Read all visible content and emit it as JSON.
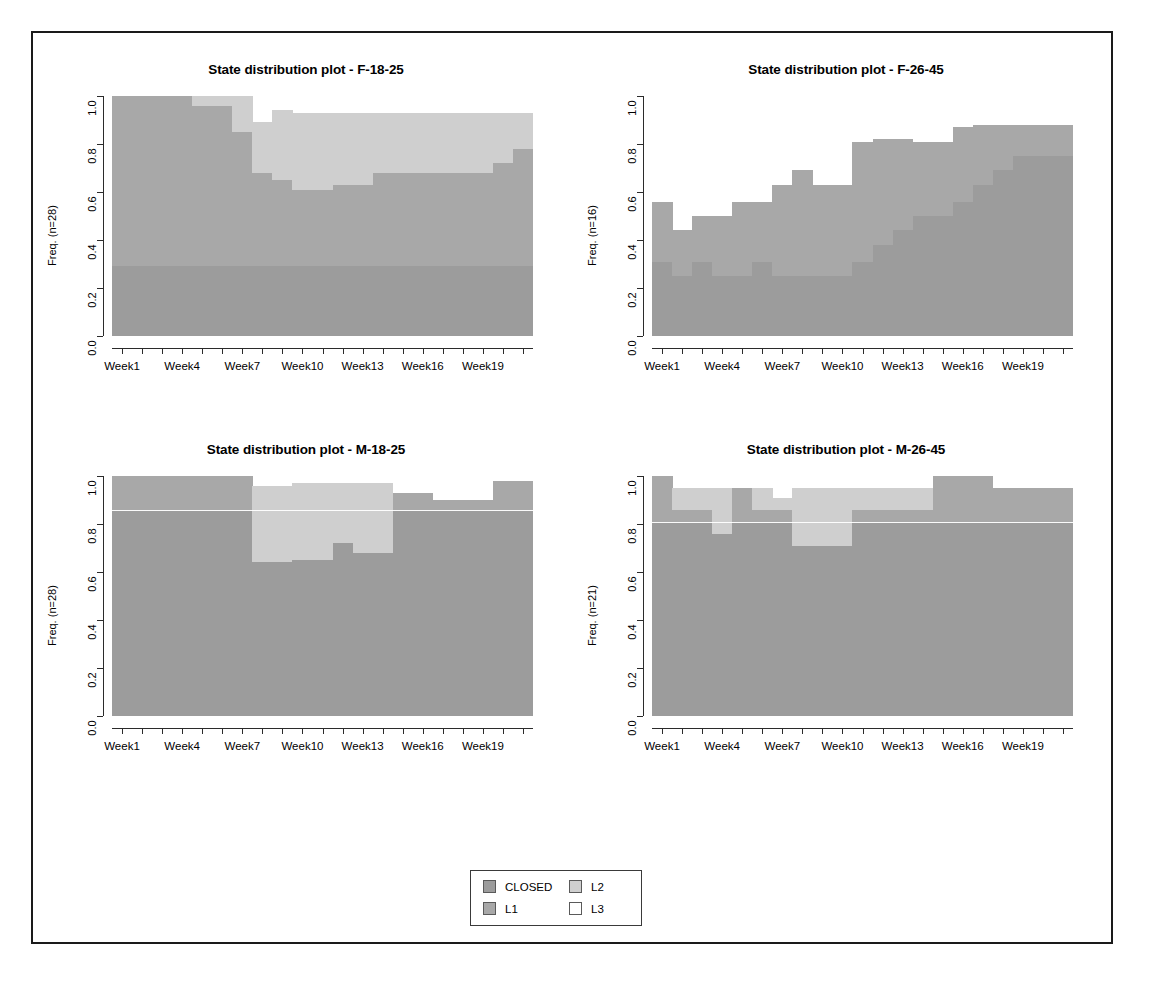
{
  "figure": {
    "panel_title_prefix": "State distribution plot - ",
    "legend": {
      "items": [
        {
          "label": "CLOSED",
          "color": "#9c9c9c"
        },
        {
          "label": "L1",
          "color": "#a8a8a8"
        },
        {
          "label": "L2",
          "color": "#cfcfcf"
        },
        {
          "label": "L3",
          "color": "#ffffff"
        }
      ]
    }
  },
  "chart_data": [
    {
      "type": "area",
      "title": "State distribution plot -  F-18-25",
      "xlabel": "",
      "ylabel": "Freq. (n=28)",
      "ylim": [
        0,
        1
      ],
      "yticks": [
        "0.0",
        "0.2",
        "0.4",
        "0.6",
        "0.8",
        "1.0"
      ],
      "categories": [
        "Week1",
        "Week2",
        "Week3",
        "Week4",
        "Week5",
        "Week6",
        "Week7",
        "Week8",
        "Week9",
        "Week10",
        "Week11",
        "Week12",
        "Week13",
        "Week14",
        "Week15",
        "Week16",
        "Week17",
        "Week18",
        "Week19",
        "Week20",
        "Week21"
      ],
      "xtick_labels": [
        "Week1",
        "Week4",
        "Week7",
        "Week10",
        "Week13",
        "Week16",
        "Week19"
      ],
      "xtick_indices": [
        0,
        3,
        6,
        9,
        12,
        15,
        18
      ],
      "legend_position": "bottom",
      "grid": false,
      "series": [
        {
          "name": "CLOSED",
          "values": [
            0.29,
            0.29,
            0.29,
            0.29,
            0.29,
            0.29,
            0.29,
            0.29,
            0.29,
            0.29,
            0.29,
            0.29,
            0.29,
            0.29,
            0.29,
            0.29,
            0.29,
            0.29,
            0.29,
            0.29,
            0.29
          ]
        },
        {
          "name": "L1",
          "values": [
            0.71,
            0.71,
            0.71,
            0.71,
            0.67,
            0.67,
            0.56,
            0.39,
            0.36,
            0.32,
            0.32,
            0.34,
            0.34,
            0.39,
            0.39,
            0.39,
            0.39,
            0.39,
            0.39,
            0.43,
            0.49
          ]
        },
        {
          "name": "L2",
          "values": [
            0.0,
            0.0,
            0.0,
            0.0,
            0.29,
            0.29,
            0.39,
            0.21,
            0.29,
            0.32,
            0.32,
            0.3,
            0.3,
            0.25,
            0.25,
            0.25,
            0.25,
            0.25,
            0.25,
            0.21,
            0.15
          ]
        },
        {
          "name": "L3",
          "values": [
            0.0,
            0.0,
            0.0,
            0.0,
            0.04,
            0.04,
            0.07,
            0.11,
            0.07,
            0.07,
            0.07,
            0.07,
            0.07,
            0.07,
            0.07,
            0.07,
            0.07,
            0.07,
            0.07,
            0.07,
            0.07
          ]
        }
      ]
    },
    {
      "type": "area",
      "title": "State distribution plot -  F-26-45",
      "xlabel": "",
      "ylabel": "Freq. (n=16)",
      "ylim": [
        0,
        1
      ],
      "yticks": [
        "0.0",
        "0.2",
        "0.4",
        "0.6",
        "0.8",
        "1.0"
      ],
      "categories": [
        "Week1",
        "Week2",
        "Week3",
        "Week4",
        "Week5",
        "Week6",
        "Week7",
        "Week8",
        "Week9",
        "Week10",
        "Week11",
        "Week12",
        "Week13",
        "Week14",
        "Week15",
        "Week16",
        "Week17",
        "Week18",
        "Week19",
        "Week20",
        "Week21"
      ],
      "xtick_labels": [
        "Week1",
        "Week4",
        "Week7",
        "Week10",
        "Week13",
        "Week16",
        "Week19"
      ],
      "xtick_indices": [
        0,
        3,
        6,
        9,
        12,
        15,
        18
      ],
      "legend_position": "bottom",
      "grid": false,
      "series": [
        {
          "name": "CLOSED",
          "values": [
            0.31,
            0.25,
            0.31,
            0.25,
            0.25,
            0.31,
            0.25,
            0.25,
            0.25,
            0.25,
            0.31,
            0.38,
            0.44,
            0.5,
            0.5,
            0.56,
            0.63,
            0.69,
            0.75,
            0.75,
            0.75
          ]
        },
        {
          "name": "L1",
          "values": [
            0.25,
            0.19,
            0.19,
            0.25,
            0.31,
            0.25,
            0.38,
            0.44,
            0.38,
            0.38,
            0.5,
            0.44,
            0.38,
            0.31,
            0.31,
            0.31,
            0.25,
            0.19,
            0.13,
            0.13,
            0.13
          ]
        },
        {
          "name": "L2",
          "values": [
            0.0,
            0.0,
            0.0,
            0.0,
            0.0,
            0.0,
            0.0,
            0.0,
            0.0,
            0.0,
            0.0,
            0.0,
            0.0,
            0.0,
            0.0,
            0.0,
            0.0,
            0.0,
            0.0,
            0.0,
            0.0
          ]
        },
        {
          "name": "L3",
          "values": [
            0.44,
            0.56,
            0.5,
            0.5,
            0.44,
            0.44,
            0.37,
            0.31,
            0.37,
            0.37,
            0.19,
            0.18,
            0.18,
            0.19,
            0.19,
            0.13,
            0.12,
            0.12,
            0.12,
            0.12,
            0.12
          ]
        }
      ]
    },
    {
      "type": "area",
      "title": "State distribution plot -  M-18-25",
      "xlabel": "",
      "ylabel": "Freq. (n=28)",
      "ylim": [
        0,
        1
      ],
      "yticks": [
        "0.0",
        "0.2",
        "0.4",
        "0.6",
        "0.8",
        "1.0"
      ],
      "categories": [
        "Week1",
        "Week2",
        "Week3",
        "Week4",
        "Week5",
        "Week6",
        "Week7",
        "Week8",
        "Week9",
        "Week10",
        "Week11",
        "Week12",
        "Week13",
        "Week14",
        "Week15",
        "Week16",
        "Week17",
        "Week18",
        "Week19",
        "Week20",
        "Week21"
      ],
      "xtick_labels": [
        "Week1",
        "Week4",
        "Week7",
        "Week10",
        "Week13",
        "Week16",
        "Week19"
      ],
      "xtick_indices": [
        0,
        3,
        6,
        9,
        12,
        15,
        18
      ],
      "legend_position": "bottom",
      "grid": false,
      "series": [
        {
          "name": "CLOSED",
          "values": [
            0.86,
            0.86,
            0.86,
            0.86,
            0.86,
            0.86,
            0.86,
            0.86,
            0.86,
            0.86,
            0.86,
            0.86,
            0.86,
            0.86,
            0.86,
            0.86,
            0.86,
            0.86,
            0.86,
            0.86,
            0.86
          ]
        },
        {
          "name": "L1",
          "values": [
            0.14,
            0.14,
            0.14,
            0.14,
            0.14,
            0.14,
            0.14,
            -0.22,
            -0.22,
            -0.21,
            -0.21,
            -0.14,
            -0.18,
            -0.18,
            0.07,
            0.07,
            0.04,
            0.04,
            0.04,
            0.12,
            0.12
          ]
        },
        {
          "name": "L2",
          "values": [
            0.0,
            0.0,
            0.0,
            0.0,
            0.0,
            0.0,
            0.0,
            0.32,
            0.32,
            0.32,
            0.32,
            0.25,
            0.29,
            0.29,
            0.0,
            0.0,
            0.0,
            0.0,
            0.0,
            0.0,
            0.0
          ]
        },
        {
          "name": "L3",
          "values": [
            0.0,
            0.0,
            0.0,
            0.0,
            0.0,
            0.0,
            0.0,
            0.04,
            0.04,
            0.03,
            0.03,
            0.03,
            0.03,
            0.03,
            0.07,
            0.07,
            0.1,
            0.1,
            0.1,
            0.02,
            0.02
          ]
        }
      ]
    },
    {
      "type": "area",
      "title": "State distribution plot -  M-26-45",
      "xlabel": "",
      "ylabel": "Freq. (n=21)",
      "ylim": [
        0,
        1
      ],
      "yticks": [
        "0.0",
        "0.2",
        "0.4",
        "0.6",
        "0.8",
        "1.0"
      ],
      "categories": [
        "Week1",
        "Week2",
        "Week3",
        "Week4",
        "Week5",
        "Week6",
        "Week7",
        "Week8",
        "Week9",
        "Week10",
        "Week11",
        "Week12",
        "Week13",
        "Week14",
        "Week15",
        "Week16",
        "Week17",
        "Week18",
        "Week19",
        "Week20",
        "Week21"
      ],
      "xtick_labels": [
        "Week1",
        "Week4",
        "Week7",
        "Week10",
        "Week13",
        "Week16",
        "Week19"
      ],
      "xtick_indices": [
        0,
        3,
        6,
        9,
        12,
        15,
        18
      ],
      "legend_position": "bottom",
      "grid": false,
      "series": [
        {
          "name": "CLOSED",
          "values": [
            0.81,
            0.81,
            0.81,
            0.81,
            0.81,
            0.81,
            0.81,
            0.81,
            0.81,
            0.81,
            0.81,
            0.81,
            0.81,
            0.81,
            0.81,
            0.81,
            0.81,
            0.81,
            0.81,
            0.81,
            0.81
          ]
        },
        {
          "name": "L1",
          "values": [
            0.19,
            0.05,
            0.05,
            -0.05,
            0.14,
            0.05,
            0.05,
            -0.1,
            -0.1,
            -0.1,
            0.05,
            0.05,
            0.05,
            0.05,
            0.19,
            0.19,
            0.19,
            0.14,
            0.14,
            0.14,
            0.14
          ]
        },
        {
          "name": "L2",
          "values": [
            0.0,
            0.09,
            0.09,
            0.19,
            0.0,
            0.09,
            0.05,
            0.24,
            0.24,
            0.24,
            0.09,
            0.09,
            0.09,
            0.09,
            0.0,
            0.0,
            0.0,
            0.0,
            0.0,
            0.0,
            0.0
          ]
        },
        {
          "name": "L3",
          "values": [
            0.0,
            0.05,
            0.05,
            0.05,
            0.05,
            0.05,
            0.09,
            0.05,
            0.05,
            0.05,
            0.05,
            0.05,
            0.05,
            0.05,
            0.0,
            0.0,
            0.0,
            0.05,
            0.05,
            0.05,
            0.05
          ]
        }
      ]
    }
  ],
  "panels": [
    {
      "id": "f-18-25",
      "title_label": "State distribution plot -  F-18-25"
    },
    {
      "id": "f-26-45",
      "title_label": "State distribution plot -  F-26-45"
    },
    {
      "id": "m-18-25",
      "title_label": "State distribution plot -  M-18-25"
    },
    {
      "id": "m-26-45",
      "title_label": "State distribution plot -  M-26-45"
    }
  ]
}
